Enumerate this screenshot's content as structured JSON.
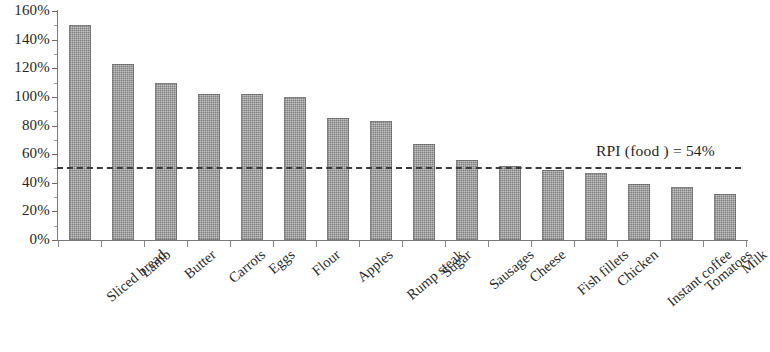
{
  "chart_data": {
    "type": "bar",
    "title": "",
    "subtitle": "",
    "xlabel": "",
    "ylabel": "",
    "ylim": [
      0,
      160
    ],
    "ytick_step": 20,
    "ytick_labels": [
      "0%",
      "20%",
      "40%",
      "60%",
      "80%",
      "100%",
      "120%",
      "140%",
      "160%"
    ],
    "ytick_values": [
      0,
      20,
      40,
      60,
      80,
      100,
      120,
      140,
      160
    ],
    "grid": false,
    "legend": "none",
    "categories": [
      "Sliced bread",
      "Lamb",
      "Butter",
      "Carrots",
      "Eggs",
      "Flour",
      "Apples",
      "Rump steak",
      "Sugar",
      "Sausages",
      "Cheese",
      "Fish fillets",
      "Chicken",
      "Instant coffee",
      "Tomatoes",
      "Milk"
    ],
    "values": [
      150,
      123,
      110,
      102,
      102,
      100,
      85,
      83,
      67,
      56,
      52,
      49,
      47,
      39,
      37,
      32
    ],
    "value_unit": "%",
    "annotations": [
      {
        "name": "rpi-food-reference",
        "text": "RPI (food ) = 54%",
        "value": 54,
        "style": "dashed-horizontal-line"
      }
    ],
    "colors": {
      "bar_fill": "#7e7e7e",
      "axis": "#7a7a7a",
      "text": "#2a2a2a",
      "reference_line": "#3b3b3b",
      "background": "#ffffff"
    }
  }
}
